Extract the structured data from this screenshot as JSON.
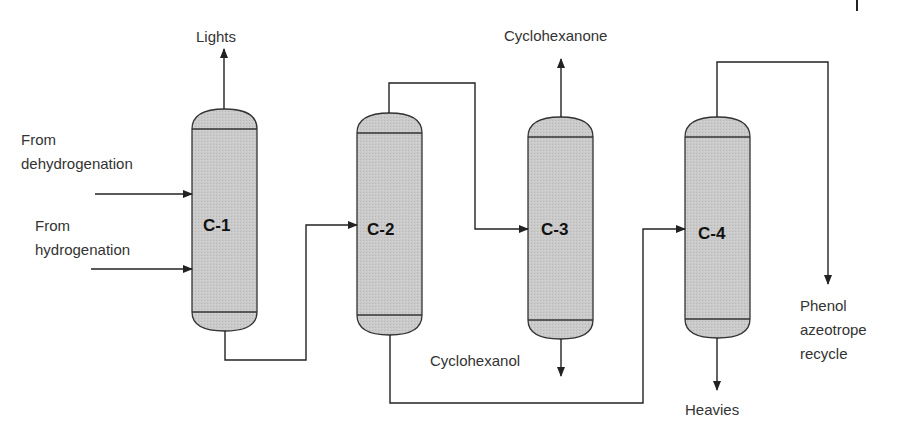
{
  "diagram": {
    "type": "process-flow",
    "columns": [
      {
        "id": "C-1",
        "label": "C-1"
      },
      {
        "id": "C-2",
        "label": "C-2"
      },
      {
        "id": "C-3",
        "label": "C-3"
      },
      {
        "id": "C-4",
        "label": "C-4"
      }
    ],
    "labels": {
      "lights": "Lights",
      "from1": "From",
      "dehydrogenation": "dehydrogenation",
      "from2": "From",
      "hydrogenation": "hydrogenation",
      "cyclohexanone": "Cyclohexanone",
      "cyclohexanol": "Cyclohexanol",
      "heavies": "Heavies",
      "phenol": "Phenol",
      "azeotrope": "azeotrope",
      "recycle": "recycle"
    },
    "streams": [
      {
        "from": "From dehydrogenation",
        "to": "C-1"
      },
      {
        "from": "From hydrogenation",
        "to": "C-1"
      },
      {
        "from": "C-1 top",
        "to": "Lights"
      },
      {
        "from": "C-1 bottom",
        "to": "C-2"
      },
      {
        "from": "C-2 top",
        "to": "C-3"
      },
      {
        "from": "C-2 bottom",
        "to": "C-4"
      },
      {
        "from": "C-3 top",
        "to": "Cyclohexanone"
      },
      {
        "from": "C-3 bottom",
        "to": "Cyclohexanol"
      },
      {
        "from": "C-4 top",
        "to": "Phenol azeotrope recycle"
      },
      {
        "from": "C-4 bottom",
        "to": "Heavies"
      }
    ],
    "colors": {
      "column_fill": "#c8c8c8",
      "line": "#222222",
      "text": "#333333"
    }
  }
}
